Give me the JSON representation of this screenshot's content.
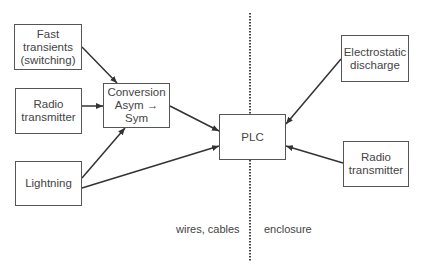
{
  "diagram": {
    "boxes": {
      "fast_transients": "Fast\ntransients\n(switching)",
      "radio_left": "Radio\ntransmitter",
      "lightning": "Lightning",
      "conversion": "Conversion\nAsym → Sym",
      "plc": "PLC",
      "electrostatic": "Electrostatic\ndischarge",
      "radio_right": "Radio\ntransmitter"
    },
    "labels": {
      "left_zone": "wires, cables",
      "right_zone": "enclosure"
    },
    "colors": {
      "line": "#333333",
      "border": "#555555",
      "text": "#444444"
    }
  }
}
